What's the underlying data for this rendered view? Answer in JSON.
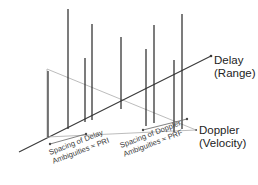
{
  "figure": {
    "background_color": "#ffffff",
    "axes": [
      {
        "id": "delay",
        "label_line1": "Delay",
        "label_line2": "(Range)",
        "color": "#3a3a3a",
        "direction": "lower-left to upper-right"
      },
      {
        "id": "doppler",
        "label_line1": "Doppler",
        "label_line2": "(Velocity)",
        "color": "#b4b4b4",
        "direction": "upper-left to lower-right"
      }
    ],
    "annotations": [
      {
        "id": "delay-spacing",
        "line1": "Spacing of Delay",
        "line2": "Ambiguities ≈ PRI",
        "rotation_deg": -21
      },
      {
        "id": "doppler-spacing",
        "line1": "Spacing of Doppler",
        "line2": "Ambiguities ≈ PRF",
        "rotation_deg": -21
      }
    ],
    "spike_color": "#2e2e2e",
    "line_colors": {
      "axis_dark": "#3a3a3a",
      "axis_light": "#b4b4b4",
      "measure": "#6b6b6b"
    }
  },
  "chart_data": {
    "type": "scatter",
    "xlabel": "Doppler (Velocity)",
    "ylabel": "Delay (Range)",
    "zlabel": "Amplitude",
    "projection": "isometric-3d-stem",
    "grid": false,
    "legend": false,
    "series": [
      {
        "name": "ambiguity-spikes",
        "points": [
          {
            "id": "s1",
            "base_x": 48,
            "base_y": 137,
            "top_y": 71,
            "height": 66
          },
          {
            "id": "s2",
            "base_x": 68,
            "base_y": 129,
            "top_y": 9,
            "height": 120
          },
          {
            "id": "s3",
            "base_x": 85,
            "base_y": 122,
            "top_y": 58,
            "height": 64
          },
          {
            "id": "s4",
            "base_x": 92,
            "base_y": 120,
            "top_y": 24,
            "height": 96
          },
          {
            "id": "s5",
            "base_x": 121,
            "base_y": 109,
            "top_y": 37,
            "height": 72
          },
          {
            "id": "s6",
            "base_x": 146,
            "base_y": 126,
            "top_y": 49,
            "height": 77
          },
          {
            "id": "s7",
            "base_x": 154,
            "base_y": 123,
            "top_y": 25,
            "height": 98
          },
          {
            "id": "s8",
            "base_x": 174,
            "base_y": 132,
            "top_y": 60,
            "height": 72
          },
          {
            "id": "s9",
            "base_x": 182,
            "base_y": 129,
            "top_y": 14,
            "height": 115
          }
        ]
      }
    ]
  }
}
